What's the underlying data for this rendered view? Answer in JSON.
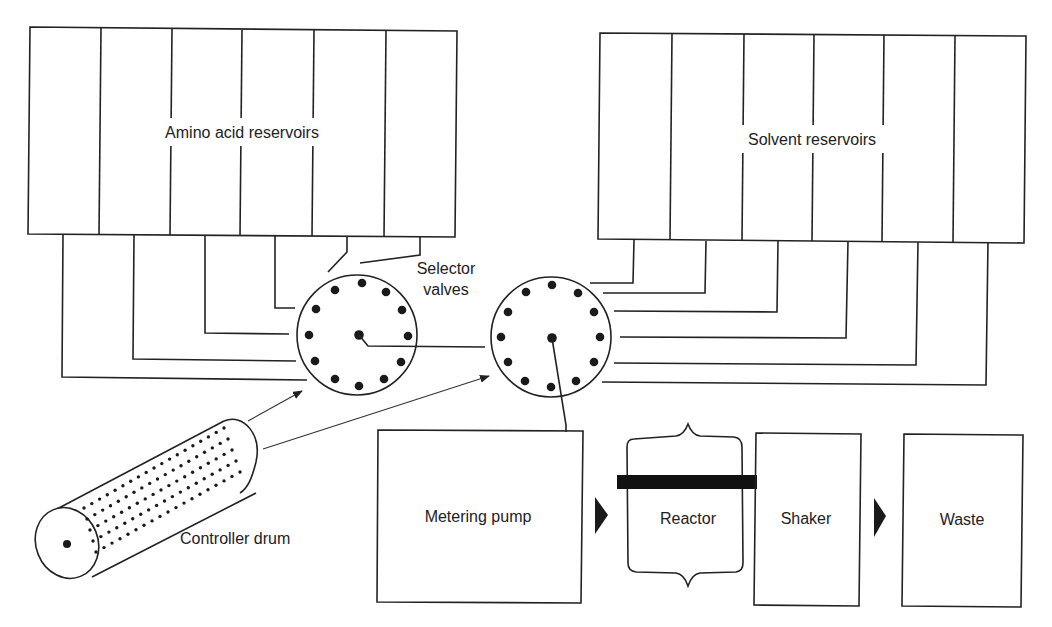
{
  "diagram": {
    "colors": {
      "ink": "#222222",
      "background": "#ffffff"
    },
    "amino_acid_reservoirs": {
      "label": "Amino acid reservoirs",
      "count": 6
    },
    "solvent_reservoirs": {
      "label": "Solvent reservoirs",
      "count": 6
    },
    "selector_valves": {
      "label_line1": "Selector",
      "label_line2": "valves",
      "count": 2,
      "ports_per_valve": 12
    },
    "controller_drum": {
      "label": "Controller drum"
    },
    "metering_pump": {
      "label": "Metering pump"
    },
    "reactor": {
      "label": "Reactor"
    },
    "shaker": {
      "label": "Shaker"
    },
    "waste": {
      "label": "Waste"
    }
  }
}
